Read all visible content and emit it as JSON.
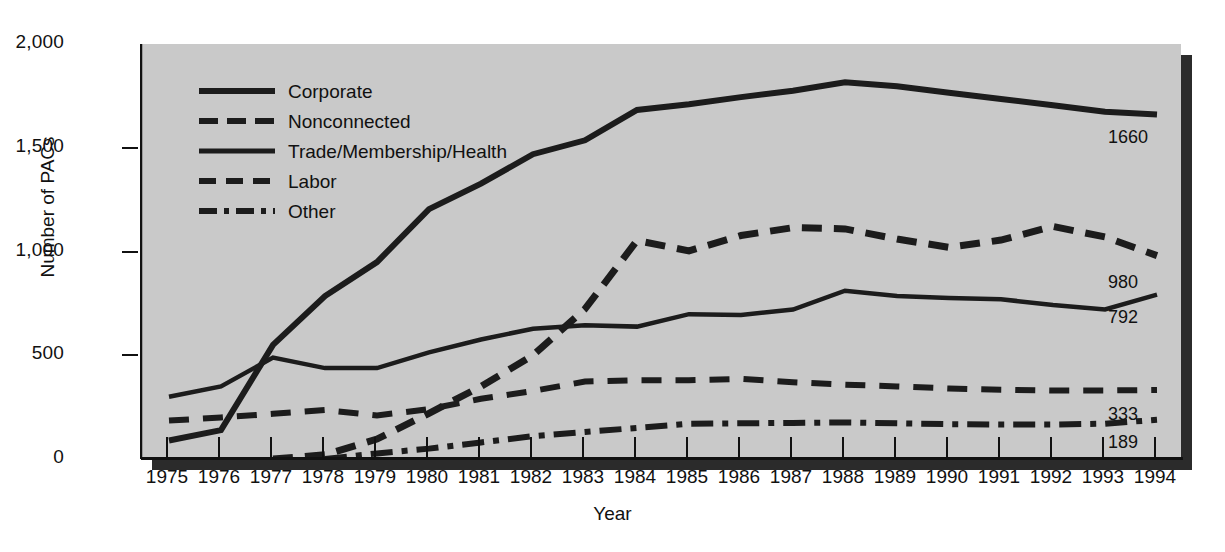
{
  "chart_data": {
    "type": "line",
    "title": "",
    "xlabel": "Year",
    "ylabel": "Number of PACs",
    "grid": false,
    "legend_position": "top-left inside plot",
    "xlim": [
      1975,
      1994
    ],
    "ylim": [
      0,
      2000
    ],
    "ytick_labels": [
      "0",
      "500",
      "1,000",
      "1,500",
      "2,000"
    ],
    "ytick_values": [
      0,
      500,
      1000,
      1500,
      2000
    ],
    "categories": [
      1975,
      1976,
      1977,
      1978,
      1979,
      1980,
      1981,
      1982,
      1983,
      1984,
      1985,
      1986,
      1987,
      1988,
      1989,
      1990,
      1991,
      1992,
      1993,
      1994
    ],
    "xtick_labels": [
      "1975",
      "1976",
      "1977",
      "1978",
      "1979",
      "1980",
      "1981",
      "1982",
      "1983",
      "1984",
      "1985",
      "1986",
      "1987",
      "1988",
      "1989",
      "1990",
      "1991",
      "1992",
      "1993",
      "1994"
    ],
    "series": [
      {
        "name": "Corporate",
        "style": "solid-thick",
        "end_label": "1660",
        "values": [
          89,
          139,
          550,
          785,
          949,
          1204,
          1327,
          1469,
          1536,
          1682,
          1710,
          1744,
          1775,
          1816,
          1796,
          1765,
          1735,
          1705,
          1674,
          1660
        ]
      },
      {
        "name": "Nonconnected",
        "style": "dashed-long",
        "end_label": "980",
        "values": [
          null,
          null,
          0,
          20,
          96,
          220,
          350,
          500,
          723,
          1053,
          1003,
          1077,
          1115,
          1109,
          1060,
          1020,
          1055,
          1121,
          1070,
          980
        ]
      },
      {
        "name": "Trade/Membership/Health",
        "style": "solid-thin",
        "end_label": "792",
        "values": [
          300,
          350,
          489,
          438,
          438,
          514,
          576,
          628,
          644,
          638,
          698,
          694,
          720,
          811,
          786,
          776,
          770,
          742,
          721,
          792
        ]
      },
      {
        "name": "Labor",
        "style": "dashed-medium",
        "end_label": "333",
        "values": [
          185,
          200,
          218,
          236,
          210,
          240,
          290,
          328,
          373,
          380,
          380,
          386,
          370,
          358,
          350,
          340,
          334,
          330,
          330,
          333
        ]
      },
      {
        "name": "Other",
        "style": "dash-dot",
        "end_label": "189",
        "values": [
          null,
          null,
          null,
          0,
          27,
          50,
          80,
          110,
          130,
          150,
          170,
          172,
          174,
          176,
          172,
          168,
          166,
          166,
          170,
          189
        ]
      }
    ],
    "end_labels": [
      "1660",
      "980",
      "792",
      "333",
      "189"
    ],
    "colors": {
      "plot_background": "#c9c9c9",
      "lines": "#1c1c1c",
      "text": "#111111",
      "shadow": "#2b2b2b"
    }
  },
  "legend": {
    "items": [
      {
        "label": "Corporate",
        "swatch": "solid-thick-line-icon"
      },
      {
        "label": "Nonconnected",
        "swatch": "long-dash-line-icon"
      },
      {
        "label": "Trade/Membership/Health",
        "swatch": "solid-thin-line-icon"
      },
      {
        "label": "Labor",
        "swatch": "medium-dash-line-icon"
      },
      {
        "label": "Other",
        "swatch": "dash-dot-line-icon"
      }
    ]
  }
}
